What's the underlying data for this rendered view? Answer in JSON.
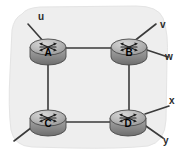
{
  "diagram": {
    "type": "network-topology",
    "background_color": "#ffffff",
    "cloud": {
      "name": "autonomous-system-region",
      "fill_color": "#eeeeee",
      "stroke_color": "#e4e4e4"
    },
    "link_color": "#3a3a3a",
    "routers": [
      {
        "id": "A",
        "label": "A",
        "cx": 48,
        "cy": 47,
        "rx": 18,
        "ry": 8
      },
      {
        "id": "B",
        "label": "B",
        "cx": 129,
        "cy": 47,
        "rx": 18,
        "ry": 8
      },
      {
        "id": "C",
        "label": "C",
        "cx": 48,
        "cy": 118,
        "rx": 18,
        "ry": 8
      },
      {
        "id": "D",
        "label": "D",
        "cx": 128,
        "cy": 118,
        "rx": 18,
        "ry": 8
      }
    ],
    "internal_links": [
      {
        "name": "link-a-b",
        "from": "A",
        "to": "B",
        "x1": 66,
        "y1": 48,
        "x2": 111,
        "y2": 48
      },
      {
        "name": "link-a-c",
        "from": "A",
        "to": "C",
        "x1": 48,
        "y1": 56,
        "x2": 48,
        "y2": 111
      },
      {
        "name": "link-b-d",
        "from": "B",
        "to": "D",
        "x1": 129,
        "y1": 56,
        "x2": 129,
        "y2": 111
      },
      {
        "name": "link-c-d",
        "from": "C",
        "to": "D",
        "x1": 66,
        "y1": 122,
        "x2": 110,
        "y2": 122
      }
    ],
    "external_links": [
      {
        "name": "external-link-u",
        "router": "A",
        "label": "u",
        "x1": 44,
        "y1": 42,
        "x2": 28,
        "y2": 24
      },
      {
        "name": "external-link-v",
        "router": "B",
        "label": "v",
        "x1": 133,
        "y1": 42,
        "x2": 156,
        "y2": 24
      },
      {
        "name": "external-link-w",
        "router": "B",
        "label": "w",
        "x1": 147,
        "y1": 50,
        "x2": 168,
        "y2": 57
      },
      {
        "name": "external-link-c",
        "router": "C",
        "label": "",
        "x1": 36,
        "y1": 124,
        "x2": 14,
        "y2": 141
      },
      {
        "name": "external-link-x",
        "router": "D",
        "label": "x",
        "x1": 145,
        "y1": 114,
        "x2": 169,
        "y2": 106
      },
      {
        "name": "external-link-y",
        "router": "D",
        "label": "y",
        "x1": 143,
        "y1": 124,
        "x2": 163,
        "y2": 138
      }
    ],
    "external_labels": [
      {
        "name": "label-u",
        "text": "u",
        "left": 38,
        "top": 12
      },
      {
        "name": "label-v",
        "text": "v",
        "left": 160,
        "top": 20
      },
      {
        "name": "label-w",
        "text": "w",
        "left": 165,
        "top": 52
      },
      {
        "name": "label-x",
        "text": "x",
        "left": 169,
        "top": 96
      },
      {
        "name": "label-y",
        "text": "y",
        "left": 163,
        "top": 136
      }
    ]
  }
}
